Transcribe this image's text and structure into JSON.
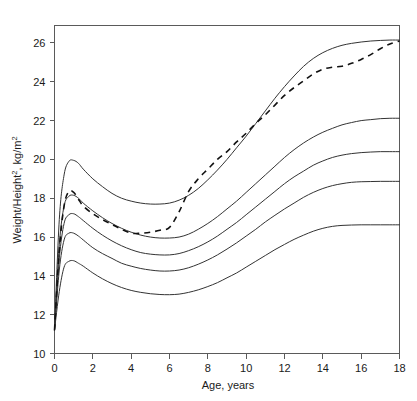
{
  "chart_data": {
    "type": "line",
    "title": "",
    "xlabel": "Age, years",
    "ylabel": "Weight/Height2, kg/m2",
    "ylabel_base": "Weight/Height",
    "ylabel_sup1": "2",
    "ylabel_mid": ", kg/m",
    "ylabel_sup2": "2",
    "xlim": [
      0,
      18
    ],
    "ylim": [
      10,
      26.9
    ],
    "grid": false,
    "legend": null,
    "xticks": [
      0,
      2,
      4,
      6,
      8,
      10,
      12,
      14,
      16,
      18
    ],
    "xtick_labels": [
      "0",
      "2",
      "4",
      "6",
      "8",
      "10",
      "12",
      "14",
      "16",
      "18"
    ],
    "yticks": [
      10,
      12,
      14,
      16,
      18,
      20,
      22,
      24,
      26
    ],
    "ytick_labels": [
      "10",
      "12",
      "14",
      "16",
      "18",
      "20",
      "22",
      "24",
      "26"
    ],
    "x": [
      0,
      0.25,
      0.5,
      0.75,
      1,
      1.25,
      1.5,
      2,
      2.5,
      3,
      3.5,
      4,
      4.5,
      5,
      5.5,
      6,
      6.5,
      7,
      7.5,
      8,
      8.5,
      9,
      9.5,
      10,
      10.5,
      11,
      11.5,
      12,
      12.5,
      13,
      13.5,
      14,
      14.5,
      15,
      15.5,
      16,
      16.5,
      17,
      17.5,
      18
    ],
    "series": [
      {
        "name": "95th percentile",
        "style": "solid",
        "values": [
          11.2,
          16.9,
          19.2,
          19.9,
          19.95,
          19.8,
          19.5,
          19.0,
          18.6,
          18.25,
          18.0,
          17.85,
          17.75,
          17.7,
          17.7,
          17.75,
          17.9,
          18.15,
          18.5,
          18.95,
          19.45,
          20.0,
          20.6,
          21.2,
          21.85,
          22.5,
          23.15,
          23.75,
          24.3,
          24.8,
          25.2,
          25.5,
          25.72,
          25.88,
          25.98,
          26.05,
          26.1,
          26.13,
          26.15,
          26.15
        ]
      },
      {
        "name": "75th percentile",
        "style": "solid",
        "values": [
          11.2,
          15.6,
          17.6,
          18.1,
          18.15,
          18.0,
          17.75,
          17.35,
          17.0,
          16.7,
          16.45,
          16.25,
          16.1,
          16.0,
          15.95,
          15.95,
          16.0,
          16.15,
          16.4,
          16.7,
          17.05,
          17.45,
          17.85,
          18.3,
          18.75,
          19.2,
          19.65,
          20.1,
          20.5,
          20.85,
          21.15,
          21.4,
          21.6,
          21.78,
          21.9,
          22.0,
          22.05,
          22.1,
          22.12,
          22.12
        ]
      },
      {
        "name": "50th percentile",
        "style": "solid",
        "values": [
          11.2,
          14.9,
          16.7,
          17.15,
          17.2,
          17.05,
          16.85,
          16.45,
          16.1,
          15.8,
          15.55,
          15.35,
          15.2,
          15.12,
          15.08,
          15.08,
          15.15,
          15.3,
          15.5,
          15.75,
          16.05,
          16.4,
          16.75,
          17.15,
          17.55,
          17.95,
          18.35,
          18.75,
          19.1,
          19.4,
          19.7,
          19.92,
          20.1,
          20.22,
          20.3,
          20.35,
          20.38,
          20.4,
          20.4,
          20.4
        ]
      },
      {
        "name": "25th percentile",
        "style": "solid",
        "values": [
          11.2,
          14.3,
          15.85,
          16.2,
          16.2,
          16.05,
          15.85,
          15.45,
          15.15,
          14.9,
          14.65,
          14.5,
          14.38,
          14.3,
          14.25,
          14.25,
          14.3,
          14.42,
          14.6,
          14.82,
          15.08,
          15.38,
          15.7,
          16.05,
          16.4,
          16.78,
          17.12,
          17.45,
          17.75,
          18.05,
          18.3,
          18.5,
          18.65,
          18.75,
          18.82,
          18.85,
          18.86,
          18.87,
          18.87,
          18.87
        ]
      },
      {
        "name": "5th percentile",
        "style": "solid",
        "values": [
          11.2,
          13.2,
          14.45,
          14.75,
          14.78,
          14.65,
          14.5,
          14.15,
          13.85,
          13.6,
          13.4,
          13.25,
          13.15,
          13.08,
          13.04,
          13.03,
          13.06,
          13.15,
          13.28,
          13.45,
          13.65,
          13.9,
          14.15,
          14.45,
          14.75,
          15.05,
          15.35,
          15.62,
          15.88,
          16.1,
          16.3,
          16.45,
          16.55,
          16.6,
          16.62,
          16.63,
          16.63,
          16.63,
          16.63,
          16.63
        ]
      },
      {
        "name": "individual subject",
        "style": "dashed",
        "values": [
          11.2,
          15.3,
          17.6,
          18.35,
          18.3,
          17.95,
          17.6,
          17.2,
          16.9,
          16.65,
          16.4,
          16.2,
          16.2,
          16.25,
          16.35,
          16.5,
          17.3,
          18.35,
          19.0,
          19.5,
          20.0,
          20.4,
          20.9,
          21.35,
          21.85,
          22.3,
          22.8,
          23.3,
          23.7,
          24.05,
          24.4,
          24.65,
          24.75,
          24.8,
          24.95,
          25.15,
          25.4,
          25.7,
          25.95,
          26.1
        ]
      }
    ]
  },
  "figure": {
    "background_color": "#ffffff",
    "axis_color": "#5a5a5a",
    "curve_color": "#333333",
    "dashed_color": "#111111"
  }
}
